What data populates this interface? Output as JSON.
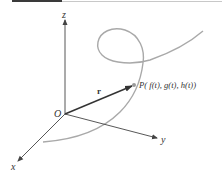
{
  "figure": {
    "type": "3d-space-curve-diagram",
    "axes": {
      "x_label": "x",
      "y_label": "y",
      "z_label": "z",
      "origin_label": "O"
    },
    "vector": {
      "label": "r"
    },
    "point": {
      "label": "P( f(t), g(t), h(t))"
    },
    "colors": {
      "axis": "#444444",
      "curve": "#a9a9a9",
      "vector": "#333333",
      "point": "#9a9a9a",
      "top_bar": "#3a3a3a"
    }
  }
}
